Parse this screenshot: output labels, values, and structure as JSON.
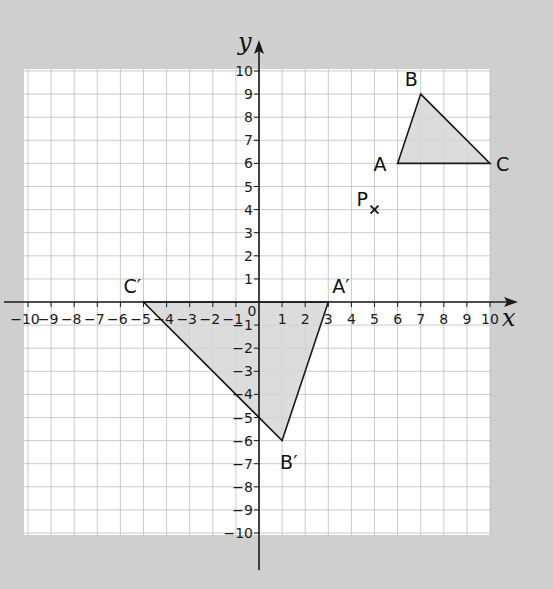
{
  "diagram": {
    "type": "coordinate-grid-rotation",
    "axes": {
      "x_label": "x",
      "y_label": "y",
      "x_range": [
        -10,
        10
      ],
      "y_range": [
        -10,
        10
      ],
      "x_ticks": [
        "−10",
        "−9",
        "−8",
        "−7",
        "−6",
        "−5",
        "−4",
        "−3",
        "−2",
        "−1",
        "1",
        "2",
        "3",
        "4",
        "5",
        "6",
        "7",
        "8",
        "9",
        "10"
      ],
      "y_ticks": [
        "10",
        "9",
        "8",
        "7",
        "6",
        "5",
        "4",
        "3",
        "2",
        "1",
        "−1",
        "−2",
        "−3",
        "−4",
        "−5",
        "−6",
        "−7",
        "−8",
        "−9",
        "−10"
      ],
      "origin_label": "0"
    },
    "grid": {
      "on": true,
      "step": 1
    },
    "colors": {
      "background": "#cfcfcf",
      "grid_bg": "#ffffff",
      "grid_line": "#bdbdbd",
      "shape_fill": "#d6d6d6",
      "line": "#1a1a1a"
    },
    "shapes": [
      {
        "name": "triangle ABC",
        "vertices": [
          {
            "label": "A",
            "x": 6,
            "y": 6
          },
          {
            "label": "B",
            "x": 7,
            "y": 9
          },
          {
            "label": "C",
            "x": 10,
            "y": 6
          }
        ]
      },
      {
        "name": "triangle A′B′C′",
        "vertices": [
          {
            "label": "A′",
            "x": 3,
            "y": 0
          },
          {
            "label": "B′",
            "x": 1,
            "y": -6
          },
          {
            "label": "C′",
            "x": -5,
            "y": 0
          }
        ]
      }
    ],
    "points": [
      {
        "label": "P",
        "x": 5,
        "y": 4,
        "marker": "×"
      }
    ]
  }
}
